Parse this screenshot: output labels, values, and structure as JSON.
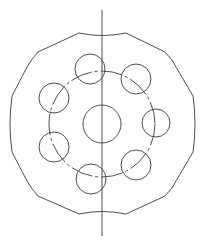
{
  "drawing": {
    "type": "mechanical-part-top-view",
    "background": "#ffffff",
    "stroke_color": "#3a3a3a",
    "center": {
      "x": 102,
      "y": 124
    },
    "axis": {
      "x": 102,
      "y_start": 10,
      "y_end": 236
    },
    "outline_path": "M 79 33 Q 102 38 126 33 L 165 52 Q 173 60 176 67 L 193 96 Q 197 124 193 152 L 176 181 Q 173 188 165 196 L 126 214 Q 102 209 79 214 L 38 196 Q 31 188 27 181 L 12 152 Q 8 124 12 96 L 27 67 Q 31 60 38 52 Z",
    "bolt_circle": {
      "cx": 102,
      "cy": 124,
      "r": 53
    },
    "center_hole": {
      "cx": 102,
      "cy": 124,
      "r": 19
    },
    "holes": [
      {
        "cx": 90,
        "cy": 69,
        "r": 15
      },
      {
        "cx": 136,
        "cy": 79,
        "r": 15
      },
      {
        "cx": 156,
        "cy": 123,
        "r": 14
      },
      {
        "cx": 136,
        "cy": 165,
        "r": 15
      },
      {
        "cx": 91,
        "cy": 179,
        "r": 15
      },
      {
        "cx": 54,
        "cy": 147,
        "r": 15
      },
      {
        "cx": 54,
        "cy": 98,
        "r": 15
      }
    ]
  }
}
